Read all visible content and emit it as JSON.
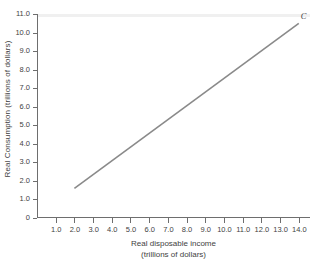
{
  "chart_data": {
    "type": "line",
    "title": "",
    "xlabel": "Real disposable income",
    "xlabel_units": "(trillions of dollars)",
    "ylabel": "Real Consumption (trillions of dollars)",
    "xlim": [
      0,
      14.6
    ],
    "ylim": [
      0,
      11.0
    ],
    "grid": false,
    "legend_position": "none",
    "xticks": [
      1.0,
      2.0,
      3.0,
      4.0,
      5.0,
      6.0,
      7.0,
      8.0,
      9.0,
      10.0,
      11.0,
      12.0,
      13.0,
      14.0
    ],
    "xtick_labels": [
      "1.0",
      "2.0",
      "3.0",
      "4.0",
      "5.0",
      "6.0",
      "7.0",
      "8.0",
      "9.0",
      "10.0",
      "11.0",
      "12.0",
      "13.0",
      "14.0"
    ],
    "yticks": [
      0,
      1.0,
      2.0,
      3.0,
      4.0,
      5.0,
      6.0,
      7.0,
      8.0,
      9.0,
      10.0,
      11.0
    ],
    "ytick_labels": [
      "0",
      "1.0",
      "2.0",
      "3.0",
      "4.0",
      "5.0",
      "6.0",
      "7.0",
      "8.0",
      "9.0",
      "10.0",
      "11.0"
    ],
    "series": [
      {
        "name": "C",
        "annotation": "C",
        "color": "#8a8a8a",
        "x": [
          2.0,
          14.0
        ],
        "values": [
          1.6,
          10.5
        ]
      }
    ]
  }
}
